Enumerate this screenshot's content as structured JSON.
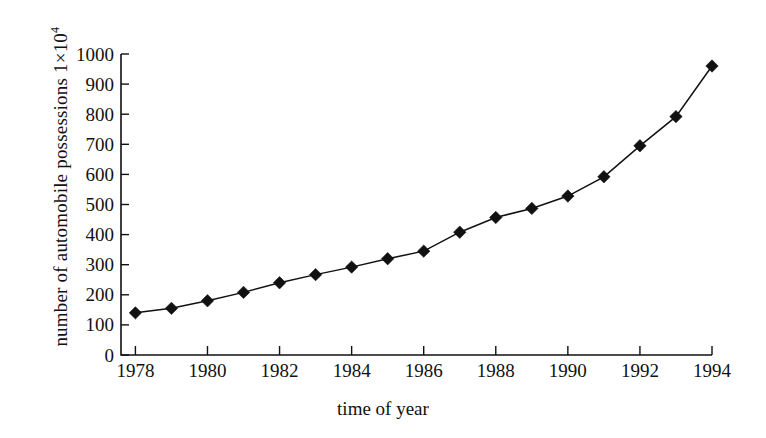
{
  "chart_data": {
    "type": "line",
    "title": "",
    "xlabel": "time of year",
    "ylabel": "number of automobile possessions 1×10⁴",
    "ylabel_base": "number of automobile possessions 1×10",
    "ylabel_exponent": "4",
    "xlim": [
      1977.6,
      1994.0
    ],
    "ylim": [
      0,
      1000
    ],
    "grid": false,
    "legend": "none",
    "marker": "filled-diamond",
    "line_color": "#111111",
    "marker_color": "#111111",
    "background_color": "#ffffff",
    "x_tick_labels": [
      "1978",
      "1980",
      "1982",
      "1984",
      "1986",
      "1988",
      "1990",
      "1992",
      "1994"
    ],
    "x_tick_values": [
      1978,
      1980,
      1982,
      1984,
      1986,
      1988,
      1990,
      1992,
      1994
    ],
    "y_tick_labels": [
      "0",
      "100",
      "200",
      "300",
      "400",
      "500",
      "600",
      "700",
      "800",
      "900",
      "1000"
    ],
    "y_tick_values": [
      0,
      100,
      200,
      300,
      400,
      500,
      600,
      700,
      800,
      900,
      1000
    ],
    "x": [
      1978,
      1979,
      1980,
      1981,
      1982,
      1983,
      1984,
      1985,
      1986,
      1987,
      1988,
      1989,
      1990,
      1991,
      1992,
      1993,
      1994
    ],
    "values": [
      140,
      155,
      180,
      208,
      240,
      267,
      292,
      320,
      345,
      408,
      457,
      487,
      528,
      592,
      695,
      792,
      960
    ],
    "series": [
      {
        "name": "automobile possessions",
        "values": [
          140,
          155,
          180,
          208,
          240,
          267,
          292,
          320,
          345,
          408,
          457,
          487,
          528,
          592,
          695,
          792,
          960
        ]
      }
    ]
  }
}
